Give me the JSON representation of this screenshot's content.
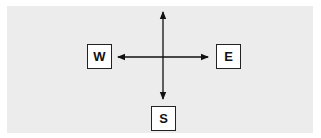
{
  "diagram": {
    "type": "compass-directions",
    "background_color": "#ececec",
    "line_color": "#111111",
    "labels": {
      "west": "W",
      "east": "E",
      "south": "S"
    },
    "arrows": [
      {
        "name": "north",
        "label": null
      },
      {
        "name": "south",
        "label": "S"
      },
      {
        "name": "west",
        "label": "W"
      },
      {
        "name": "east",
        "label": "E"
      }
    ]
  }
}
